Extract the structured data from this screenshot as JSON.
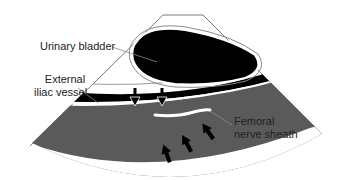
{
  "diagram": {
    "labels": {
      "urinary_bladder": "Urinary bladder",
      "external_iliac_line1": "External",
      "external_iliac_line2": "iliac vessel",
      "femoral_line1": "Femoral",
      "femoral_line2": "nerve sheath"
    },
    "structures": [
      {
        "name": "Urinary bladder",
        "appearance": "black (anechoic)"
      },
      {
        "name": "External iliac vessel",
        "appearance": "black band"
      },
      {
        "name": "Femoral nerve sheath",
        "appearance": "white line"
      },
      {
        "name": "Muscle / soft tissue",
        "appearance": "gray region"
      }
    ],
    "arrows": {
      "down_hollow_head_count": 2,
      "up_black_count": 3
    },
    "colors": {
      "bladder": "#000000",
      "vessel_band": "#000000",
      "tissue": "#5a5a5a",
      "outline": "#7a7a7a",
      "text": "#222222"
    }
  }
}
